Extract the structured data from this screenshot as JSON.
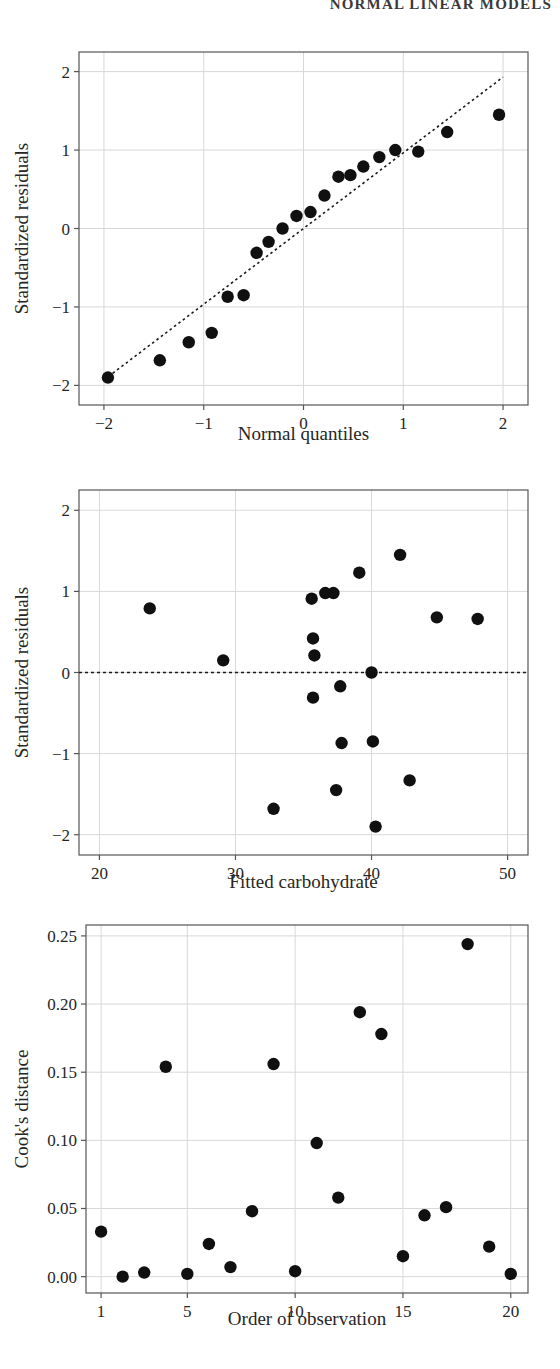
{
  "page": {
    "running_header": "NORMAL LINEAR MODELS",
    "background_color": "#ffffff",
    "point_color": "#101010",
    "axis_color": "#555555",
    "grid_color": "#d8d8d8",
    "reference_line_color": "#1a1a1a"
  },
  "chart_data": [
    {
      "id": "normal-qq-plot",
      "type": "scatter",
      "title": "",
      "xlabel": "Normal quantiles",
      "ylabel": "Standardized residuals",
      "xlim": [
        -2.25,
        2.25
      ],
      "ylim": [
        -2.25,
        2.25
      ],
      "xticks": [
        -2,
        -1,
        0,
        1,
        2
      ],
      "xticklabels": [
        "−2",
        "−1",
        "0",
        "1",
        "2"
      ],
      "yticks": [
        -2,
        -1,
        0,
        1,
        2
      ],
      "yticklabels": [
        "−2",
        "−1",
        "0",
        "1",
        "2"
      ],
      "grid": true,
      "legend": "none",
      "annotations": [
        {
          "kind": "reference-line",
          "style": "dotted",
          "description": "45-degree normal reference line",
          "x1": -2.0,
          "y1": -1.93,
          "x2": 2.0,
          "y2": 1.93
        }
      ],
      "points": [
        {
          "x": -1.96,
          "y": -1.9
        },
        {
          "x": -1.44,
          "y": -1.68
        },
        {
          "x": -1.15,
          "y": -1.45
        },
        {
          "x": -0.92,
          "y": -1.33
        },
        {
          "x": -0.76,
          "y": -0.87
        },
        {
          "x": -0.6,
          "y": -0.85
        },
        {
          "x": -0.47,
          "y": -0.31
        },
        {
          "x": -0.35,
          "y": -0.17
        },
        {
          "x": -0.21,
          "y": 0.0
        },
        {
          "x": -0.07,
          "y": 0.16
        },
        {
          "x": 0.07,
          "y": 0.21
        },
        {
          "x": 0.21,
          "y": 0.42
        },
        {
          "x": 0.35,
          "y": 0.66
        },
        {
          "x": 0.47,
          "y": 0.68
        },
        {
          "x": 0.6,
          "y": 0.79
        },
        {
          "x": 0.76,
          "y": 0.91
        },
        {
          "x": 0.92,
          "y": 1.0
        },
        {
          "x": 1.15,
          "y": 0.98
        },
        {
          "x": 1.44,
          "y": 1.23
        },
        {
          "x": 1.96,
          "y": 1.45
        }
      ]
    },
    {
      "id": "residuals-vs-fitted-plot",
      "type": "scatter",
      "title": "",
      "xlabel": "Fitted carbohydrate",
      "ylabel": "Standardized residuals",
      "xlim": [
        18.5,
        51.5
      ],
      "ylim": [
        -2.25,
        2.25
      ],
      "xticks": [
        20,
        30,
        40,
        50
      ],
      "xticklabels": [
        "20",
        "30",
        "40",
        "50"
      ],
      "yticks": [
        -2,
        -1,
        0,
        1,
        2
      ],
      "yticklabels": [
        "−2",
        "−1",
        "0",
        "1",
        "2"
      ],
      "grid": true,
      "legend": "none",
      "annotations": [
        {
          "kind": "reference-line",
          "style": "dashed",
          "description": "horizontal zero residual line",
          "y": 0.0
        }
      ],
      "points": [
        {
          "x": 23.7,
          "y": 0.79
        },
        {
          "x": 29.1,
          "y": 0.15
        },
        {
          "x": 32.8,
          "y": -1.68
        },
        {
          "x": 35.6,
          "y": 0.91
        },
        {
          "x": 35.7,
          "y": 0.42
        },
        {
          "x": 35.8,
          "y": 0.21
        },
        {
          "x": 35.7,
          "y": -0.31
        },
        {
          "x": 36.6,
          "y": 0.98
        },
        {
          "x": 37.2,
          "y": 0.98
        },
        {
          "x": 37.4,
          "y": -1.45
        },
        {
          "x": 37.7,
          "y": -0.17
        },
        {
          "x": 37.8,
          "y": -0.87
        },
        {
          "x": 39.1,
          "y": 1.23
        },
        {
          "x": 40.0,
          "y": 0.0
        },
        {
          "x": 40.1,
          "y": -0.85
        },
        {
          "x": 40.3,
          "y": -1.9
        },
        {
          "x": 42.1,
          "y": 1.45
        },
        {
          "x": 42.8,
          "y": -1.33
        },
        {
          "x": 44.8,
          "y": 0.68
        },
        {
          "x": 47.8,
          "y": 0.66
        }
      ]
    },
    {
      "id": "cooks-distance-plot",
      "type": "scatter",
      "title": "",
      "xlabel": "Order of observation",
      "ylabel": "Cook's distance",
      "xlim": [
        0.3,
        20.8
      ],
      "ylim": [
        -0.012,
        0.258
      ],
      "xticks": [
        1,
        5,
        10,
        15,
        20
      ],
      "xticklabels": [
        "1",
        "5",
        "10",
        "15",
        "20"
      ],
      "yticks": [
        0.0,
        0.05,
        0.1,
        0.15,
        0.2,
        0.25
      ],
      "yticklabels": [
        "0.00",
        "0.05",
        "0.10",
        "0.15",
        "0.20",
        "0.25"
      ],
      "grid": true,
      "legend": "none",
      "annotations": [],
      "points": [
        {
          "x": 1,
          "y": 0.033
        },
        {
          "x": 2,
          "y": 0.0
        },
        {
          "x": 3,
          "y": 0.003
        },
        {
          "x": 4,
          "y": 0.154
        },
        {
          "x": 5,
          "y": 0.002
        },
        {
          "x": 6,
          "y": 0.024
        },
        {
          "x": 7,
          "y": 0.007
        },
        {
          "x": 8,
          "y": 0.048
        },
        {
          "x": 9,
          "y": 0.156
        },
        {
          "x": 10,
          "y": 0.004
        },
        {
          "x": 11,
          "y": 0.098
        },
        {
          "x": 12,
          "y": 0.058
        },
        {
          "x": 13,
          "y": 0.194
        },
        {
          "x": 14,
          "y": 0.178
        },
        {
          "x": 15,
          "y": 0.015
        },
        {
          "x": 16,
          "y": 0.045
        },
        {
          "x": 17,
          "y": 0.051
        },
        {
          "x": 18,
          "y": 0.244
        },
        {
          "x": 19,
          "y": 0.022
        },
        {
          "x": 20,
          "y": 0.002
        }
      ]
    }
  ]
}
